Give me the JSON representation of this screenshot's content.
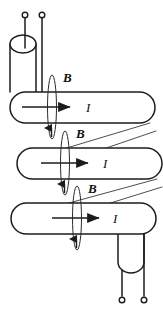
{
  "figure": {
    "background_color": "#ffffff",
    "line_color": "#1c1c1c",
    "thin_line_color": "#3a3a3a",
    "width": 163,
    "height": 316
  },
  "labels": {
    "field_symbol": "B",
    "current_symbol": "I"
  },
  "bars": [
    {
      "name": "top-bar",
      "current_label": "I",
      "field_label": "B",
      "x": 10,
      "y": 92,
      "width": 145,
      "height": 31,
      "arrow_start_x": 22,
      "arrow_end_x": 75,
      "arrow_y": 107,
      "current_label_x": 86,
      "current_label_y": 112,
      "field_label_x": 63,
      "field_label_y": 82,
      "loop_cx": 52,
      "loop_cy": 107,
      "loop_rx": 4.5,
      "loop_ry": 32,
      "loop_arrow_dir": "up"
    },
    {
      "name": "middle-bar",
      "current_label": "I",
      "field_label": "B",
      "x": 17,
      "y": 148,
      "width": 145,
      "height": 31,
      "arrow_start_x": 41,
      "arrow_end_x": 92,
      "arrow_y": 163,
      "current_label_x": 103,
      "current_label_y": 168,
      "field_label_x": 76,
      "field_label_y": 138,
      "loop_cx": 65,
      "loop_cy": 163,
      "loop_rx": 4.5,
      "loop_ry": 32,
      "loop_arrow_dir": "up"
    },
    {
      "name": "bottom-bar",
      "current_label": "I",
      "field_label": "B",
      "x": 11,
      "y": 203,
      "width": 145,
      "height": 31,
      "arrow_start_x": 52,
      "arrow_end_x": 103,
      "arrow_y": 218,
      "current_label_x": 113,
      "current_label_y": 223,
      "field_label_x": 88,
      "field_label_y": 193,
      "loop_cx": 77,
      "loop_cy": 218,
      "loop_rx": 4.5,
      "loop_ry": 32,
      "loop_arrow_dir": "up"
    }
  ],
  "top_connector": {
    "name": "top-cylinder",
    "ellipse_cx": 23,
    "ellipse_cy": 44,
    "ellipse_rx": 13,
    "ellipse_ry": 9,
    "left_wall_x": 10,
    "right_wall_x": 36,
    "bottom_y": 92,
    "terminal_left": {
      "cx": 25,
      "cy": 15,
      "r": 2.8,
      "stem_to_y": 44
    },
    "terminal_right": {
      "cx": 42,
      "cy": 15,
      "r": 2.8,
      "stem_to_y": 92
    }
  },
  "bottom_connector": {
    "name": "bottom-cylinder",
    "arc_cx": 131,
    "arc_cy": 262,
    "arc_rx": 13,
    "arc_ry": 11,
    "left_wall_x": 118,
    "right_wall_x": 144,
    "top_y": 234,
    "terminal_left": {
      "cx": 122,
      "cy": 300,
      "r": 2.8,
      "stem_from_y": 272
    },
    "terminal_right": {
      "cx": 144,
      "cy": 300,
      "r": 2.8,
      "stem_from_y": 234
    }
  },
  "diagonals": [
    {
      "name": "diagonal-top-to-middle-front",
      "x1": 20,
      "y1": 162,
      "x2": 150,
      "y2": 123
    },
    {
      "name": "diagonal-top-to-middle-back",
      "x1": 36,
      "y1": 170,
      "x2": 155,
      "y2": 131
    },
    {
      "name": "diagonal-middle-to-bottom-front",
      "x1": 14,
      "y1": 218,
      "x2": 157,
      "y2": 179
    },
    {
      "name": "diagonal-middle-to-bottom-back",
      "x1": 30,
      "y1": 226,
      "x2": 162,
      "y2": 187
    }
  ]
}
